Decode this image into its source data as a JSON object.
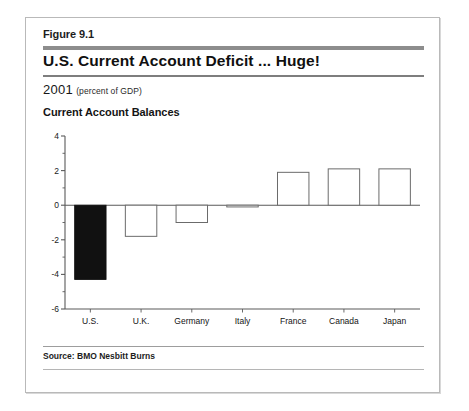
{
  "figure": {
    "label": "Figure 9.1",
    "title": "U.S. Current Account Deficit ... Huge!",
    "subtitle_year": "2001",
    "subtitle_units": "(percent of GDP)",
    "chart_heading": "Current Account Balances",
    "source": "Source: BMO Nesbitt Burns"
  },
  "colors": {
    "highlight_bar": "#111111",
    "bar_outline": "#6b6b6b",
    "bar_fill": "#ffffff",
    "axis": "#5a5a5a",
    "rule_thick": "#8d8d8d",
    "rule_thin": "#7e7e7e",
    "frame": "#b9b9b9",
    "text": "#141414"
  },
  "chart_data": {
    "type": "bar",
    "title": "Current Account Balances",
    "subtitle": "2001 (percent of GDP)",
    "xlabel": "",
    "ylabel": "",
    "ylim": [
      -6,
      4
    ],
    "yticks": [
      4,
      2,
      0,
      -2,
      -4,
      -6
    ],
    "ytick_labels": [
      "4",
      "2",
      "0",
      "-2",
      "-4",
      "-6"
    ],
    "minor_ticks": true,
    "grid": false,
    "legend": null,
    "zero_line": 0,
    "categories": [
      "U.S.",
      "U.K.",
      "Germany",
      "Italy",
      "France",
      "Canada",
      "Japan"
    ],
    "values": [
      -4.3,
      -1.8,
      -1.0,
      -0.1,
      1.9,
      2.1,
      2.1
    ],
    "highlighted": [
      "U.S."
    ],
    "units": "percent of GDP",
    "source": "BMO Nesbitt Burns"
  }
}
